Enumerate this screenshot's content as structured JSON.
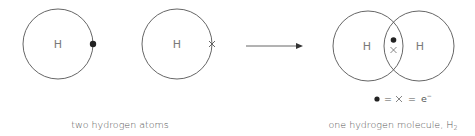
{
  "atoms": [
    {
      "label": "H",
      "electron": "●"
    },
    {
      "label": "H",
      "electron": "×"
    }
  ],
  "molecule": {
    "left_label": "H",
    "right_label": "H",
    "shared_electrons": [
      "●",
      "×"
    ]
  },
  "legend": {
    "dot": "●",
    "eq1": "=",
    "cross": "×",
    "eq2": "=",
    "electron": "e",
    "electron_sup": "−"
  },
  "captions": {
    "left": "two hydrogen atoms",
    "right_main": "one hydrogen molecule, H",
    "right_sub": "2"
  },
  "colors": {
    "stroke": "#555555",
    "text": "#7a7a7a",
    "dot": "#222222"
  }
}
